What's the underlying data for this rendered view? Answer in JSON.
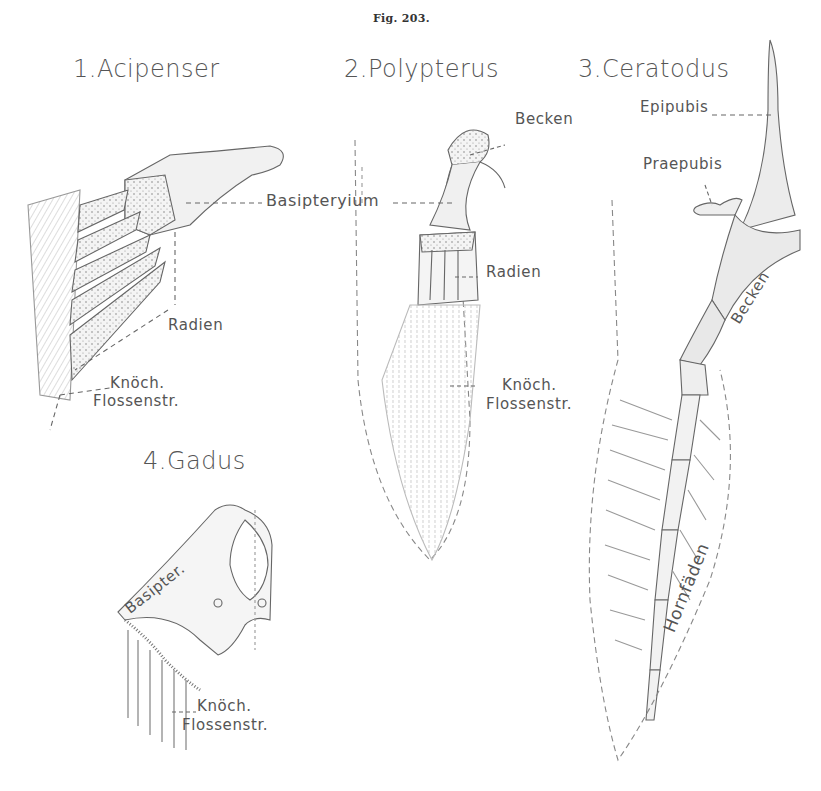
{
  "figure": {
    "number": "Fig. 203."
  },
  "panels": [
    {
      "id": "acipenser",
      "title": "1.Acipenser",
      "labels": {
        "basipterygium": "Basipteryium",
        "radien": "Radien",
        "knoch": "Knöch.",
        "flossenstr": "Flossenstr."
      }
    },
    {
      "id": "polypterus",
      "title": "2.Polypterus",
      "labels": {
        "becken": "Becken",
        "radien": "Radien",
        "knoch": "Knöch.",
        "flossenstr": "Flossenstr."
      }
    },
    {
      "id": "ceratodus",
      "title": "3.Ceratodus",
      "labels": {
        "epipubis": "Epipubis",
        "praepubis": "Praepubis",
        "becken": "Becken",
        "hornfaeden": "Hornfäden"
      }
    },
    {
      "id": "gadus",
      "title": "4.Gadus",
      "labels": {
        "basipter": "Basipter.",
        "knoch": "Knöch.",
        "flossenstr": "Flossenstr."
      }
    }
  ],
  "colors": {
    "ink": "#555555",
    "line": "#6a6a6a",
    "shade": "#d9d9d9",
    "background": "#ffffff"
  }
}
